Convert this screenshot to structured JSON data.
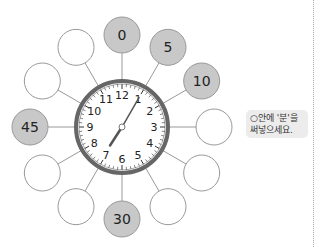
{
  "circles": [
    {
      "angle": 0,
      "label": "0",
      "filled": true
    },
    {
      "angle": 30,
      "label": "5",
      "filled": true
    },
    {
      "angle": 60,
      "label": "10",
      "filled": true
    },
    {
      "angle": 90,
      "label": "",
      "filled": false
    },
    {
      "angle": 120,
      "label": "",
      "filled": false
    },
    {
      "angle": 150,
      "label": "",
      "filled": false
    },
    {
      "angle": 180,
      "label": "30",
      "filled": true
    },
    {
      "angle": 210,
      "label": "",
      "filled": false
    },
    {
      "angle": 240,
      "label": "",
      "filled": false
    },
    {
      "angle": 270,
      "label": "45",
      "filled": true
    },
    {
      "angle": 300,
      "label": "",
      "filled": false
    },
    {
      "angle": 330,
      "label": "",
      "filled": false
    }
  ],
  "clock": {
    "numbers": [
      "12",
      "1",
      "2",
      "3",
      "4",
      "5",
      "6",
      "7",
      "8",
      "9",
      "10",
      "11"
    ],
    "hour_angle": 213,
    "minute_angle": 30
  },
  "note": {
    "line1": "○안에 '분'을",
    "line2": "써넣으세요."
  }
}
